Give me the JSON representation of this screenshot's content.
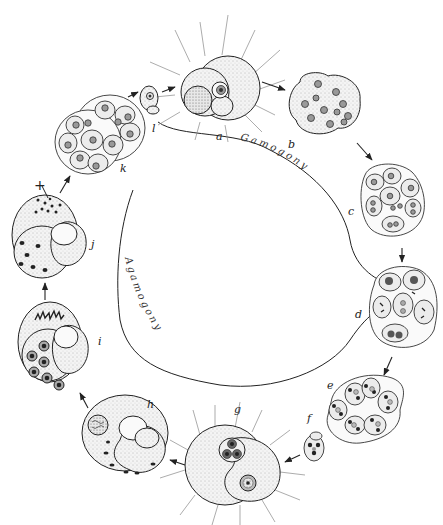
{
  "figure": {
    "cycles": {
      "upper": "Gamogony",
      "lower": "Agamogony"
    },
    "stages": [
      {
        "id": "a",
        "label": "a"
      },
      {
        "id": "b",
        "label": "b"
      },
      {
        "id": "c",
        "label": "c"
      },
      {
        "id": "d",
        "label": "d"
      },
      {
        "id": "e",
        "label": "e"
      },
      {
        "id": "f",
        "label": "f"
      },
      {
        "id": "g",
        "label": "g"
      },
      {
        "id": "h",
        "label": "h"
      },
      {
        "id": "i",
        "label": "i"
      },
      {
        "id": "j",
        "label": "j"
      },
      {
        "id": "k",
        "label": "k"
      },
      {
        "id": "l",
        "label": "l"
      }
    ],
    "annotations": {
      "meiosis_mark": "+"
    }
  }
}
